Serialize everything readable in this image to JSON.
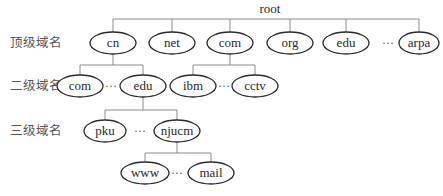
{
  "diagram": {
    "type": "tree",
    "root": {
      "label": "root",
      "x": 270,
      "y": 12
    },
    "level_labels": [
      {
        "label": "顶级域名",
        "y": 47
      },
      {
        "label": "二级域名",
        "y": 90
      },
      {
        "label": "三级域名",
        "y": 135
      }
    ],
    "ellipsis": "···",
    "level1": {
      "nodes": [
        {
          "id": "cn",
          "label": "cn",
          "x": 113
        },
        {
          "id": "net",
          "label": "net",
          "x": 172
        },
        {
          "id": "com",
          "label": "com",
          "x": 230
        },
        {
          "id": "org",
          "label": "org",
          "x": 290
        },
        {
          "id": "edu",
          "label": "edu",
          "x": 346
        },
        {
          "id": "arpa",
          "label": "arpa",
          "x": 419
        }
      ],
      "ellipsis_x": 391
    },
    "level2_cn": {
      "parent": "cn",
      "nodes": [
        {
          "id": "cn-com",
          "label": "com",
          "x": 80
        },
        {
          "id": "cn-edu",
          "label": "edu",
          "x": 143
        }
      ],
      "ellipsis_x": 111
    },
    "level2_com": {
      "parent": "com",
      "nodes": [
        {
          "id": "com-ibm",
          "label": "ibm",
          "x": 193
        },
        {
          "id": "com-cctv",
          "label": "cctv",
          "x": 255
        }
      ],
      "ellipsis_x": 224
    },
    "level3_edu": {
      "parent": "cn-edu",
      "nodes": [
        {
          "id": "pku",
          "label": "pku",
          "x": 105
        },
        {
          "id": "njucm",
          "label": "njucm",
          "x": 177
        }
      ],
      "ellipsis_x": 140
    },
    "level4_njucm": {
      "parent": "njucm",
      "nodes": [
        {
          "id": "www",
          "label": "www",
          "x": 145
        },
        {
          "id": "mail",
          "label": "mail",
          "x": 211
        }
      ],
      "ellipsis_x": 177
    }
  }
}
